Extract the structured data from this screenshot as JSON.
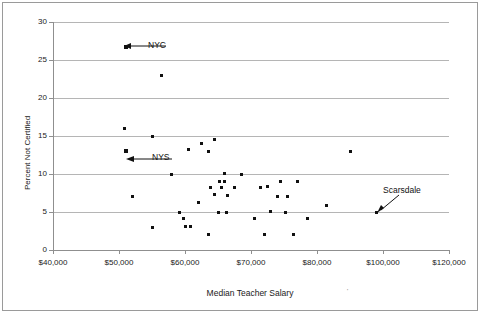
{
  "chart_data": {
    "type": "scatter",
    "title": "",
    "xlabel": "Median Teacher Salary",
    "ylabel": "Percent Not Certified",
    "xlim": [
      40000,
      120000
    ],
    "ylim": [
      0,
      30
    ],
    "grid": true,
    "legend": "none",
    "x_tick_labels": [
      "$40,000",
      "$50,000",
      "$60,000",
      "$70,000",
      "$80,000",
      "$100,000",
      "$120,000"
    ],
    "y_tick_labels": [
      "0",
      "5",
      "10",
      "15",
      "20",
      "25",
      "30"
    ],
    "y_ticks": [
      0,
      5,
      10,
      15,
      20,
      25,
      30
    ],
    "points": [
      {
        "x": 51000,
        "y": 26.7,
        "label": "NYC",
        "emphasis": true
      },
      {
        "x": 56500,
        "y": 23.0,
        "label": "",
        "emphasis": false
      },
      {
        "x": 50800,
        "y": 16.0,
        "label": "",
        "emphasis": false
      },
      {
        "x": 55000,
        "y": 15.0,
        "label": "",
        "emphasis": false
      },
      {
        "x": 51000,
        "y": 13.0,
        "label": "NYS",
        "emphasis": true
      },
      {
        "x": 62500,
        "y": 14.0,
        "label": "",
        "emphasis": false
      },
      {
        "x": 64500,
        "y": 14.6,
        "label": "",
        "emphasis": false
      },
      {
        "x": 60500,
        "y": 13.2,
        "label": "",
        "emphasis": false
      },
      {
        "x": 63500,
        "y": 13.0,
        "label": "",
        "emphasis": false
      },
      {
        "x": 90000,
        "y": 13.0,
        "label": "",
        "emphasis": false
      },
      {
        "x": 58000,
        "y": 10.0,
        "label": "",
        "emphasis": false
      },
      {
        "x": 66000,
        "y": 10.1,
        "label": "",
        "emphasis": false
      },
      {
        "x": 68500,
        "y": 10.0,
        "label": "",
        "emphasis": false
      },
      {
        "x": 52000,
        "y": 7.0,
        "label": "",
        "emphasis": false
      },
      {
        "x": 65200,
        "y": 9.0,
        "label": "",
        "emphasis": false
      },
      {
        "x": 66000,
        "y": 9.0,
        "label": "",
        "emphasis": false
      },
      {
        "x": 74500,
        "y": 9.0,
        "label": "",
        "emphasis": false
      },
      {
        "x": 77000,
        "y": 9.0,
        "label": "",
        "emphasis": false
      },
      {
        "x": 63800,
        "y": 8.2,
        "label": "",
        "emphasis": false
      },
      {
        "x": 65500,
        "y": 8.2,
        "label": "",
        "emphasis": false
      },
      {
        "x": 67500,
        "y": 8.2,
        "label": "",
        "emphasis": false
      },
      {
        "x": 71500,
        "y": 8.2,
        "label": "",
        "emphasis": false
      },
      {
        "x": 72500,
        "y": 8.3,
        "label": "",
        "emphasis": false
      },
      {
        "x": 64500,
        "y": 7.3,
        "label": "",
        "emphasis": false
      },
      {
        "x": 66500,
        "y": 7.2,
        "label": "",
        "emphasis": false
      },
      {
        "x": 74000,
        "y": 7.0,
        "label": "",
        "emphasis": false
      },
      {
        "x": 75500,
        "y": 7.0,
        "label": "",
        "emphasis": false
      },
      {
        "x": 62000,
        "y": 6.2,
        "label": "",
        "emphasis": false
      },
      {
        "x": 59200,
        "y": 5.0,
        "label": "",
        "emphasis": false
      },
      {
        "x": 65000,
        "y": 5.0,
        "label": "",
        "emphasis": false
      },
      {
        "x": 66300,
        "y": 5.0,
        "label": "",
        "emphasis": false
      },
      {
        "x": 73000,
        "y": 5.1,
        "label": "",
        "emphasis": false
      },
      {
        "x": 75200,
        "y": 5.0,
        "label": "",
        "emphasis": false
      },
      {
        "x": 98000,
        "y": 5.0,
        "label": "Scarsdale",
        "emphasis": false
      },
      {
        "x": 59800,
        "y": 4.2,
        "label": "",
        "emphasis": false
      },
      {
        "x": 70500,
        "y": 4.2,
        "label": "",
        "emphasis": false
      },
      {
        "x": 78500,
        "y": 4.2,
        "label": "",
        "emphasis": false
      },
      {
        "x": 83000,
        "y": 5.8,
        "label": "",
        "emphasis": false
      },
      {
        "x": 60000,
        "y": 3.1,
        "label": "",
        "emphasis": false
      },
      {
        "x": 60800,
        "y": 3.1,
        "label": "",
        "emphasis": false
      },
      {
        "x": 55000,
        "y": 3.0,
        "label": "",
        "emphasis": false
      },
      {
        "x": 63500,
        "y": 2.1,
        "label": "",
        "emphasis": false
      },
      {
        "x": 72000,
        "y": 2.0,
        "label": "",
        "emphasis": false
      },
      {
        "x": 76500,
        "y": 2.0,
        "label": "",
        "emphasis": false
      }
    ],
    "annotations": [
      {
        "name": "NYC",
        "text": "NYC",
        "target_x": 51000,
        "target_y": 26.7
      },
      {
        "name": "NYS",
        "text": "NYS",
        "target_x": 51000,
        "target_y": 13.0
      },
      {
        "name": "Scarsdale",
        "text": "Scarsdale",
        "target_x": 98000,
        "target_y": 5.0
      }
    ]
  },
  "colors": {
    "marker": "#111111",
    "grid": "#b5b5b5",
    "axis": "#8f8f8f",
    "frame": "#9a9a9a",
    "text": "#1a1a1a"
  }
}
